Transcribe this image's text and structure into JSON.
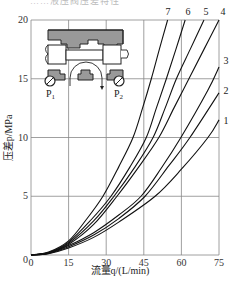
{
  "header_fragment": "……液压阀压差特性",
  "chart_data": {
    "type": "line",
    "title": "",
    "xlabel": "流量q/(L/min)",
    "ylabel": "压差p/MPa",
    "xlim": [
      0,
      75
    ],
    "ylim": [
      0,
      20
    ],
    "xticks": [
      0,
      15,
      30,
      45,
      60,
      75
    ],
    "yticks": [
      0,
      5,
      10,
      15,
      20
    ],
    "grid": true,
    "legend": "curve numbers labeled at line ends",
    "series": [
      {
        "name": "1",
        "points": [
          [
            0,
            0
          ],
          [
            7,
            0.12
          ],
          [
            15,
            0.6
          ],
          [
            25,
            1.5
          ],
          [
            35,
            2.8
          ],
          [
            49.5,
            5
          ],
          [
            60,
            7.3
          ],
          [
            70.6,
            10
          ],
          [
            75,
            11.5
          ]
        ]
      },
      {
        "name": "2",
        "points": [
          [
            0,
            0
          ],
          [
            7,
            0.14
          ],
          [
            15,
            0.7
          ],
          [
            25,
            1.7
          ],
          [
            35,
            3.1
          ],
          [
            45.5,
            5
          ],
          [
            55,
            7.6
          ],
          [
            63.4,
            10
          ],
          [
            75,
            13.8
          ]
        ]
      },
      {
        "name": "3",
        "points": [
          [
            0,
            0
          ],
          [
            7,
            0.16
          ],
          [
            15,
            0.8
          ],
          [
            25,
            1.9
          ],
          [
            35,
            3.4
          ],
          [
            43.9,
            5
          ],
          [
            52,
            7.4
          ],
          [
            59.8,
            10
          ],
          [
            70.5,
            14
          ],
          [
            75,
            16
          ]
        ]
      },
      {
        "name": "4",
        "points": [
          [
            0,
            0
          ],
          [
            7,
            0.18
          ],
          [
            15,
            0.9
          ],
          [
            25,
            2.6
          ],
          [
            34.3,
            5
          ],
          [
            43,
            7.5
          ],
          [
            51,
            10
          ],
          [
            57,
            12.5
          ],
          [
            63,
            15
          ],
          [
            69,
            17.5
          ],
          [
            75,
            20
          ]
        ]
      },
      {
        "name": "5",
        "points": [
          [
            0,
            0
          ],
          [
            7,
            0.2
          ],
          [
            15,
            1.0
          ],
          [
            25,
            2.9
          ],
          [
            33.1,
            5
          ],
          [
            41.5,
            7.5
          ],
          [
            48.7,
            10
          ],
          [
            53.5,
            12.5
          ],
          [
            58,
            15
          ],
          [
            63.5,
            17.5
          ],
          [
            69,
            20
          ]
        ]
      },
      {
        "name": "6",
        "points": [
          [
            0,
            0
          ],
          [
            7,
            0.22
          ],
          [
            15,
            1.1
          ],
          [
            24,
            3.0
          ],
          [
            31.9,
            5
          ],
          [
            39.5,
            7.5
          ],
          [
            46,
            10
          ],
          [
            50,
            12.5
          ],
          [
            54,
            15
          ],
          [
            57.8,
            17.5
          ],
          [
            61.5,
            20
          ]
        ]
      },
      {
        "name": "7",
        "points": [
          [
            0,
            0
          ],
          [
            7,
            0.25
          ],
          [
            15,
            1.2
          ],
          [
            22,
            3.0
          ],
          [
            28.7,
            5
          ],
          [
            35,
            7.5
          ],
          [
            40.7,
            10
          ],
          [
            44.5,
            12.5
          ],
          [
            48,
            15
          ],
          [
            51.2,
            17.5
          ],
          [
            54.5,
            20
          ]
        ]
      }
    ],
    "inset_diagram": {
      "description": "valve cross-section with pressure gauges",
      "labels": [
        "P1",
        "P2"
      ]
    }
  },
  "axes": {
    "xlabel": "流量q/(L/min)",
    "ylabel": "压差p/MPa",
    "xticks": [
      "0",
      "15",
      "30",
      "45",
      "60",
      "75"
    ],
    "yticks": [
      "0",
      "5",
      "10",
      "15",
      "20"
    ]
  },
  "curve_labels": [
    "1",
    "2",
    "3",
    "4",
    "5",
    "6",
    "7"
  ],
  "inset": {
    "p1": "P",
    "p1_sub": "1",
    "p2": "P",
    "p2_sub": "2"
  }
}
